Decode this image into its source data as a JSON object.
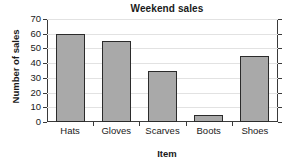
{
  "chart_data": {
    "type": "bar",
    "title": "Weekend sales",
    "xlabel": "Item",
    "ylabel": "Number of sales",
    "categories": [
      "Hats",
      "Gloves",
      "Scarves",
      "Boots",
      "Shoes"
    ],
    "values": [
      60,
      55,
      35,
      5,
      45
    ],
    "ylim": [
      0,
      70
    ],
    "ytick_labels": [
      "0",
      "10",
      "20",
      "30",
      "40",
      "50",
      "60",
      "70"
    ],
    "ytick_values": [
      0,
      10,
      20,
      30,
      40,
      50,
      60,
      70
    ],
    "grid": true,
    "legend": null,
    "colors": {
      "bar_fill": "#a9a9a9",
      "bar_edge": "#2b2b2b",
      "gridline": "#e2e2e2",
      "axis": "#3a3a3a",
      "text": "#1a1a1a",
      "background": "#ffffff"
    }
  }
}
